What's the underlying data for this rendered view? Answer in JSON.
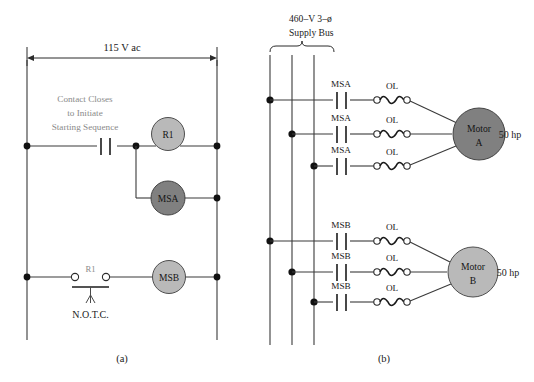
{
  "figure": {
    "title_a": "(a)",
    "title_b": "(b)",
    "background": "#ffffff"
  },
  "colors": {
    "wire": "#3a3a3a",
    "coil_dark": "#808080",
    "coil_light": "#b9b9b9",
    "note_text": "#8a8a8a",
    "text": "#1a1a1a"
  },
  "control_circuit": {
    "supply_label": "115 V ac",
    "note_lines": [
      "Contact Closes",
      "to Initiate",
      "Starting Sequence"
    ],
    "coils": [
      {
        "name": "R1",
        "label": "R1",
        "shade": "light"
      },
      {
        "name": "MSA",
        "label": "MSA",
        "shade": "dark"
      },
      {
        "name": "MSB",
        "label": "MSB",
        "shade": "light"
      }
    ],
    "switch": {
      "contact_label": "R1",
      "type_label": "N.O.T.C."
    },
    "caption": "(a)"
  },
  "power_circuit": {
    "bus_label_lines": [
      "460–V 3–ø",
      "Supply Bus"
    ],
    "bus_phase_count": 3,
    "motors": [
      {
        "name": "Motor A",
        "label_line1": "Motor",
        "label_line2": "A",
        "rating": "50 hp",
        "shade": "dark",
        "contactor_label": "MSA",
        "overload_label": "OL",
        "phases": 3
      },
      {
        "name": "Motor B",
        "label_line1": "Motor",
        "label_line2": "B",
        "rating": "50 hp",
        "shade": "light",
        "contactor_label": "MSB",
        "overload_label": "OL",
        "phases": 3
      }
    ],
    "caption": "(b)"
  }
}
